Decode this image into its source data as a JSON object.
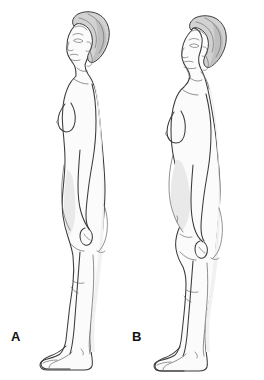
{
  "illustration": {
    "title": "Lateral view comparison of standing posture in an older adult woman",
    "subject": "elderly-woman-side-profile",
    "view": "lateral-left-facing",
    "background_color": "#ffffff",
    "line_color": "#3a3a3a",
    "line_color_soft": "#6b6b6b",
    "skin_fill": "#fbfbfb",
    "shadow_fill": "#f0f0f0",
    "hair_fill": "#d2d2d2",
    "hair_shadow_fill": "#bdbdbd"
  },
  "panels": [
    {
      "id": "A",
      "label": "A",
      "name": "panel-a-normal-posture",
      "description": "Normal erect standing posture: head aligned over shoulders, gentle spinal curves, flat abdomen, full standing height.",
      "posture_features": [
        "head centered over trunk",
        "normal thoracic curve",
        "mild abdominal protrusion",
        "full stature"
      ]
    },
    {
      "id": "B",
      "label": "B",
      "name": "panel-b-altered-posture",
      "description": "Age-related postural change: forward head position, increased thoracic kyphosis, rounded upper back, protruding abdomen, reduced standing height.",
      "posture_features": [
        "forward head posture",
        "increased thoracic kyphosis",
        "protuberant abdomen",
        "decreased stature"
      ]
    }
  ],
  "labels": {
    "panel_a": "A",
    "panel_b": "B"
  }
}
